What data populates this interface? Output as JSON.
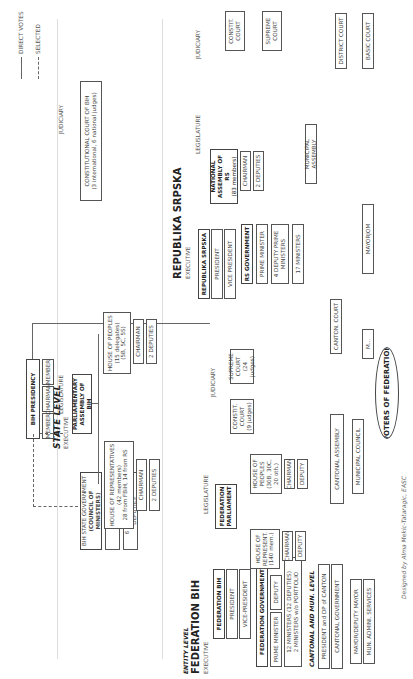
{
  "legend": {
    "direct_votes": "DIRECT VOTES",
    "selected": "SELECTED"
  },
  "columns": {
    "executive": "EXECUTIVE",
    "legislature": "LEGISLATURE",
    "judiciary": "JUDICIARY"
  },
  "state_level": {
    "title": "STATE LEVEL",
    "subtitle": "EXECUTIVE",
    "presidency": {
      "title": "BIH PRESIDENCY",
      "members": [
        "MEMBER",
        "CHAIRMAN",
        "MEMBER"
      ]
    },
    "council": {
      "title_line1": "BIH STATE GOVERNMENT",
      "title_line2": "(COUNCIL OF MINISTERS)",
      "chairman": "CHAIRMAN",
      "ministers": "6 MINISTERS, 12 DEPUTIES"
    },
    "parliament": {
      "title": "PARLIAMENTARY\nASSEMBLY OF BIH",
      "house_reps": "HOUSE OF REPRESENTATIVES\n(42 members)\n28 from FBiH, 14 from RS",
      "house_reps_chairman": "CHAIRMAN",
      "house_reps_deputies": "2 DEPUTIES",
      "house_peoples": "HOUSE OF PEOPLES\n(15 delegates)\n(5B, 5C, 5S)",
      "house_peoples_chairman": "CHAIRMAN",
      "house_peoples_deputies": "2 DEPUTIES"
    },
    "constitutional_court": "CONSTITUTIONAL COURT OF BIH\n(3 international, 6 national judges)"
  },
  "federation": {
    "level_label": "ENTITY LEVEL",
    "title": "FEDERATION BIH",
    "subtitle": "EXECUTIVE",
    "fbih": {
      "title": "FEDERATION BIH",
      "president": "PRESIDENT",
      "vice_president": "VICE-PRESIDENT"
    },
    "government": {
      "title": "FEDERATION GOVERNMENT",
      "prime_minister": "PRIME MINISTER",
      "deputy": "DEPUTY",
      "ministers": "12 MINISTERS (12 DEPUTIES)\n2 MINISTERS w/o PORTFOLIO"
    },
    "parliament": {
      "title": "FEDERATION\nPARLIAMENT",
      "house_reps": "HOUSE OF\nREPRESENT.\n(140 mem.)",
      "house_reps_chairman": "CHAIRMAN",
      "house_reps_deputy": "DEPUTY",
      "house_peoples": "HOUSE OF\nPEOPLES\n(30B, 30C,\n20 oth.)",
      "house_peoples_chairman": "CHAIRMAN",
      "house_peoples_deputy": "DEPUTY"
    },
    "courts": {
      "constit": "CONSTIT.\nCOURT\n(9 judges)",
      "supreme": "SUPREME\nCOURT\n(24 judges)",
      "canton": "CANTON. COURT",
      "municipal": "M..."
    },
    "cantonal": {
      "label": "CANTONAL AND MUN. LEVEL",
      "president": "PRESIDENT and DP of CANTON",
      "government": "CANTONAL GOVERNMENT",
      "assembly": "CANTONAL ASSEMBLY",
      "municipal_council": "MUNICIPAL COUNCIL",
      "mayor": "MAYOR/DEPUTY MAYOR",
      "admin": "MUN. ADMINI. SERVICES"
    },
    "voters": "VOTERS OF FEDERATION"
  },
  "republika_srpska": {
    "title": "REPUBLIKA SRPSKA",
    "subtitle": "EXECUTIVE",
    "rs": {
      "title": "REPUBLIKA SRPSKA",
      "president": "PRESIDENT",
      "vice_president": "VICE PRESIDENT"
    },
    "government": {
      "title": "RS GOVERNMENT",
      "prime_minister": "PRIME MINISTER",
      "deputies": "4 DEPUTY PRIME\nMINISTERS",
      "ministers": "17 MINISTERS"
    },
    "assembly": {
      "title": "NATIONAL\nASSEMBLY OF RS",
      "members": "(83 members)",
      "chairman": "CHAIRMAN",
      "deputies": "2 DEPUTIES",
      "municipal": "MUNICIPAL ASSEMBLY"
    },
    "courts": {
      "constit": "CONSTIT.\nCOURT",
      "supreme": "SUPREME\nCOURT",
      "district": "DISTRICT COURT",
      "basic": "BASIC COURT"
    },
    "mayor": "MAYORJOM"
  },
  "credit": "Designed by Alma Mekic-Tataragic, EASC"
}
